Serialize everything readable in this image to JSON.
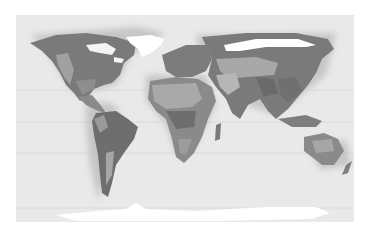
{
  "map": {
    "title": "",
    "projection": "world",
    "style": "grayscale climate zones",
    "colors": {
      "ocean": "#e9e9e9",
      "ice": "#ffffff",
      "zone_dark": "#6e6e6e",
      "zone_mid": "#8c8c8c",
      "zone_light": "#a9a9a9",
      "zone_pale": "#c4c4c4",
      "gridline": "#d6d6d6"
    },
    "gridlines_y": [
      75,
      107,
      138,
      193
    ]
  }
}
